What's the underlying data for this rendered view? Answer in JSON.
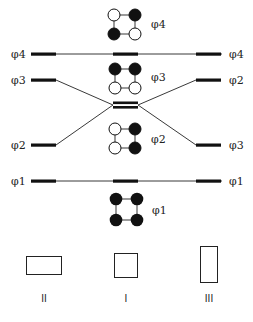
{
  "diagram": {
    "type": "energy-level correlation diagram",
    "colors": {
      "ink": "#111111",
      "filled": "#111111",
      "empty": "#ffffff",
      "background": "#ffffff"
    },
    "levels": [
      {
        "id": "phi4",
        "left_label": "φ4",
        "right_label": "φ4",
        "center_label": "φ4",
        "left_y": 54,
        "right_y": 54,
        "center_y": 54,
        "connector": "straight"
      },
      {
        "id": "phi3-phi2",
        "left_label": "φ3",
        "right_label": "φ2",
        "left_y": 80,
        "right_y": 80,
        "center_y": 105,
        "connector": "crossing"
      },
      {
        "id": "phi2-phi3",
        "left_label": "φ2",
        "right_label": "φ3",
        "left_y": 145,
        "right_y": 145,
        "center_y": 105,
        "connector": "crossing"
      },
      {
        "id": "phi1",
        "left_label": "φ1",
        "right_label": "φ1",
        "left_y": 181,
        "right_y": 181,
        "center_y": 181,
        "connector": "straight"
      }
    ],
    "orbitals": [
      {
        "label": "φ4",
        "pattern": [
          "empty",
          "filled",
          "filled",
          "empty"
        ],
        "cy_top": 15,
        "cy_bottom": 34
      },
      {
        "label": "φ3",
        "pattern": [
          "filled",
          "filled",
          "empty",
          "empty"
        ],
        "cy_top": 69,
        "cy_bottom": 88
      },
      {
        "label": "φ2",
        "pattern": [
          "empty",
          "filled",
          "empty",
          "filled"
        ],
        "cy_top": 129,
        "cy_bottom": 148
      },
      {
        "label": "φ1",
        "pattern": [
          "filled",
          "filled",
          "filled",
          "filled"
        ],
        "cy_top": 199,
        "cy_bottom": 220
      }
    ],
    "shapes": [
      {
        "label": "II",
        "kind": "wide rectangle"
      },
      {
        "label": "I",
        "kind": "square"
      },
      {
        "label": "III",
        "kind": "tall rectangle"
      }
    ]
  }
}
